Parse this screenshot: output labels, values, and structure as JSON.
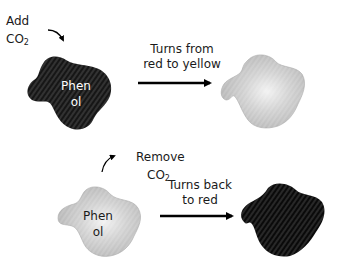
{
  "diagram": {
    "step1": {
      "action_line1": "Add",
      "action_line2": "CO",
      "action_sub": "2",
      "blob_label_line1": "Phen",
      "blob_label_line2": "ol",
      "arrow_label_line1": "Turns from",
      "arrow_label_line2": "red to yellow",
      "start_color": "#161616",
      "end_color": "#c4c4c4"
    },
    "step2": {
      "action_line1": "Remove",
      "action_line2": "CO",
      "action_sub": "2",
      "blob_label_line1": "Phen",
      "blob_label_line2": "ol",
      "arrow_label_line1": "Turns back",
      "arrow_label_line2": "to red",
      "start_color": "#c4c4c4",
      "end_color": "#0a0a0a"
    }
  }
}
